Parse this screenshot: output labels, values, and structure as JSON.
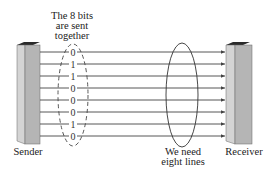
{
  "labels": {
    "top_line1": "The 8 bits",
    "top_line2": "are sent",
    "top_line3": "together",
    "sender": "Sender",
    "receiver": "Receiver",
    "need_line1": "We need",
    "need_line2": "eight lines"
  },
  "bits": [
    "0",
    "1",
    "1",
    "0",
    "0",
    "0",
    "1",
    "0"
  ],
  "line_count": 8,
  "colors": {
    "device_front": "#b5b5b5",
    "device_side": "#d0d0d0",
    "device_top": "#2a2a2a",
    "line": "#444444",
    "text": "#222222"
  }
}
